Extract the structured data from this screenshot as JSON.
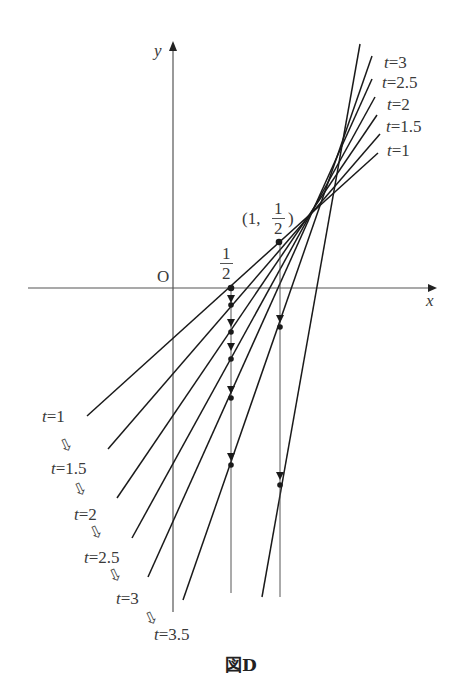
{
  "figure": {
    "caption": "図D",
    "axes": {
      "x_label": "x",
      "y_label": "y",
      "origin_label": "O"
    },
    "points": {
      "half_label_num": "1",
      "half_label_den": "2",
      "point_label_prefix": "(1,",
      "point_label_num": "1",
      "point_label_den": "2",
      "point_label_suffix": ")"
    },
    "top_labels": [
      {
        "t": "t",
        "eq": "=3"
      },
      {
        "t": "t",
        "eq": "=2.5"
      },
      {
        "t": "t",
        "eq": "=2"
      },
      {
        "t": "t",
        "eq": "=1.5"
      },
      {
        "t": "t",
        "eq": "=1"
      }
    ],
    "bottom_labels": [
      {
        "t": "t",
        "eq": "=1"
      },
      {
        "t": "t",
        "eq": "=1.5"
      },
      {
        "t": "t",
        "eq": "=2"
      },
      {
        "t": "t",
        "eq": "=2.5"
      },
      {
        "t": "t",
        "eq": "=3"
      },
      {
        "t": "t",
        "eq": "=3.5"
      }
    ],
    "sequence_arrow_glyph": "⇩",
    "lines": [
      {
        "name": "t=1",
        "x1": 87,
        "y1": 416,
        "x2": 378,
        "y2": 153
      },
      {
        "name": "t=1.5",
        "x1": 108,
        "y1": 449,
        "x2": 380,
        "y2": 134
      },
      {
        "name": "t=2",
        "x1": 117,
        "y1": 498,
        "x2": 377,
        "y2": 115
      },
      {
        "name": "t=2.5",
        "x1": 132,
        "y1": 538,
        "x2": 375,
        "y2": 97
      },
      {
        "name": "t=3",
        "x1": 148,
        "y1": 577,
        "x2": 372,
        "y2": 79
      },
      {
        "name": "t=3.5",
        "x1": 183,
        "y1": 600,
        "x2": 372,
        "y2": 56
      },
      {
        "name": "steep",
        "x1": 262,
        "y1": 597,
        "x2": 360,
        "y2": 44
      }
    ],
    "colors": {
      "line": "#1a1a1a",
      "axis": "#555555",
      "text": "#3a3a3a"
    }
  }
}
